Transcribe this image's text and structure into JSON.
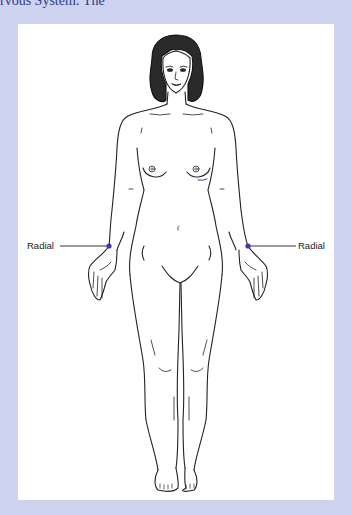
{
  "header": {
    "title": "rvous System: The"
  },
  "diagram": {
    "labels": {
      "left_pulse": "Radial",
      "right_pulse": "Radial"
    },
    "colors": {
      "background": "#cdd2ee",
      "panel": "#ffffff",
      "outline": "#222222",
      "pulse_point": "#3a3aa8",
      "header_text": "#2e3a8c"
    }
  }
}
